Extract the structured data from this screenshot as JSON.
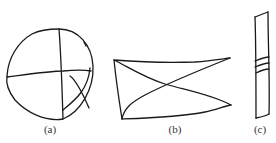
{
  "figure": {
    "panels": [
      {
        "id": "a",
        "label": "(a)",
        "shape": "circle-with-cross-lines",
        "label_pos": {
          "x": 50,
          "y": 124
        }
      },
      {
        "id": "b",
        "label": "(b)",
        "shape": "quadrilateral-with-diagonals",
        "label_pos": {
          "x": 175,
          "y": 124
        }
      },
      {
        "id": "c",
        "label": "(c)",
        "shape": "narrow-strip-with-bands",
        "label_pos": {
          "x": 260,
          "y": 124
        }
      }
    ],
    "stroke_color": "#1a1a1a",
    "background": "#ffffff"
  }
}
